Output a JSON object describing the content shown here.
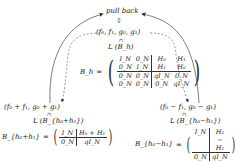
{
  "diagram": {
    "top_label": "pull back",
    "down_arrow_glyph": "⇩",
    "center_node": {
      "tuple": "(f₀, f₁, g₀, g₁)",
      "in_symbol": "∩",
      "space": "L (B_h)"
    },
    "center_matrix": {
      "lhs": "B_h",
      "eq": "=",
      "rows": [
        [
          "I_N",
          "0_N",
          "H₀",
          "H₁"
        ],
        [
          "0_N",
          "I_N",
          "H₁",
          "H₀"
        ],
        [
          "0_N",
          "0_N",
          "qI_N",
          "0_N"
        ],
        [
          "0_N",
          "0_N",
          "0_N",
          "qI_N"
        ]
      ]
    },
    "left_node": {
      "tuple": "(f₀ + f₁, g₀ + g₁)",
      "in_symbol": "∩",
      "space": "L (B_{h₀+h₁})",
      "matrix_lhs": "B_{h₀+h₁}",
      "eq": "=",
      "rows": [
        [
          "I_N",
          "H₀ + H₁"
        ],
        [
          "0_N",
          "qI_N"
        ]
      ]
    },
    "right_node": {
      "tuple": "(f₀ − f₁, g₀ − g₁)",
      "in_symbol": "∩",
      "space": "L (B_{h₀−h₁})",
      "matrix_lhs": "B_{h₀−h₁}",
      "eq": "=",
      "rows": [
        [
          "I_N",
          "H₀ − H₁"
        ],
        [
          "0_N",
          "qI_N"
        ]
      ]
    },
    "edges": [
      {
        "from": "left_node",
        "to": "top_label",
        "style": "solid"
      },
      {
        "from": "right_node",
        "to": "top_label",
        "style": "solid"
      },
      {
        "from": "center_node",
        "to": "left_node",
        "style": "dashed"
      },
      {
        "from": "center_node",
        "to": "right_node",
        "style": "dashed"
      }
    ],
    "colors": {
      "ink": "#222222",
      "background": "#ffffff"
    }
  }
}
